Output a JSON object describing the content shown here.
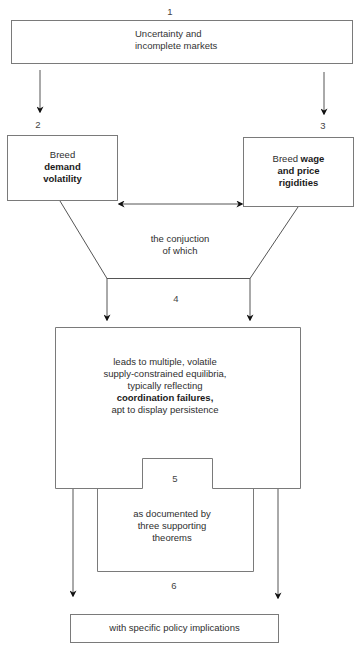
{
  "diagram": {
    "nodes": [
      {
        "id": "1",
        "number": "1",
        "lines": [
          "Uncertainty and",
          "incomplete markets"
        ]
      },
      {
        "id": "2",
        "number": "2",
        "line1": "Breed",
        "bold1": "demand",
        "bold2": "volatility"
      },
      {
        "id": "3",
        "number": "3",
        "plain": "Breed ",
        "bold1": "wage",
        "bold2": "and price",
        "bold3": "rigidities"
      },
      {
        "id": "4",
        "number": "4",
        "lines": [
          "leads to multiple, volatile",
          "supply-constrained equilibria,",
          "typically reflecting"
        ],
        "bold": "coordination failures,",
        "last": "apt to display persistence"
      },
      {
        "id": "5",
        "number": "5",
        "lines": [
          "as documented by",
          "three supporting",
          "theorems"
        ]
      },
      {
        "id": "6",
        "number": "6",
        "text": "with specific policy implications"
      }
    ],
    "connector_label": [
      "the conjuction",
      "of which"
    ],
    "colors": {
      "line": "#6b6b6b",
      "arrowhead": "#111111",
      "box_border": "#7a7a7a"
    }
  }
}
